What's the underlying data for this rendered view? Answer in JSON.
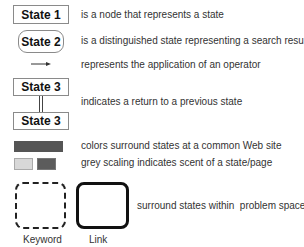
{
  "legend": {
    "items": [
      {
        "symbol": "State 1",
        "description": "is a node that represents a state"
      },
      {
        "symbol": "State 2",
        "description": "is a distinguished state representing a search result page"
      },
      {
        "symbol": "arrow",
        "description": "represents the application of an operator"
      },
      {
        "symbol_top": "State 3",
        "symbol_bottom": "State 3",
        "description": "indicates a return to a previous state"
      },
      {
        "symbol": "dark-bar",
        "description": "colors surround states at a common Web site"
      },
      {
        "symbol": "grey-squares",
        "description": "grey scaling indicates scent of a state/page"
      },
      {
        "description": "surround states within  problem spaces"
      }
    ],
    "problem_spaces": {
      "keyword_label": "Keyword",
      "link_label": "Link"
    }
  },
  "colors": {
    "site_bar": "#555555",
    "scent_light": "#d8d8d8",
    "scent_dark": "#5c5c5c"
  }
}
